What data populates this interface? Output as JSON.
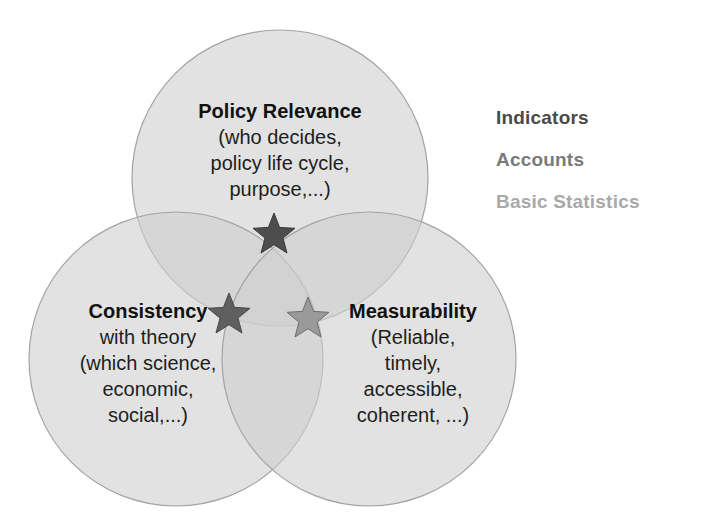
{
  "circles": [
    {
      "id": "policy-relevance",
      "title": "Policy Relevance",
      "lines": [
        "(who decides,",
        "policy life cycle,",
        "purpose,...)"
      ],
      "star_color": "#4d4d4d"
    },
    {
      "id": "consistency",
      "title": "Consistency",
      "lines": [
        "with theory",
        "(which science,",
        "economic,",
        "social,...)"
      ],
      "star_color": "#5f5f5f"
    },
    {
      "id": "measurability",
      "title": "Measurability",
      "lines": [
        "(Reliable,",
        "timely,",
        "accessible,",
        "coherent, ...)"
      ],
      "star_color": "#9a9a9a"
    }
  ],
  "legend": [
    {
      "label": "Indicators",
      "color": "#4a4a4a"
    },
    {
      "label": "Accounts",
      "color": "#7a7a7a"
    },
    {
      "label": "Basic Statistics",
      "color": "#a9a9a9"
    }
  ],
  "colors": {
    "circle_fill": "#d4d4d4",
    "circle_stroke": "#a8a8a8"
  }
}
